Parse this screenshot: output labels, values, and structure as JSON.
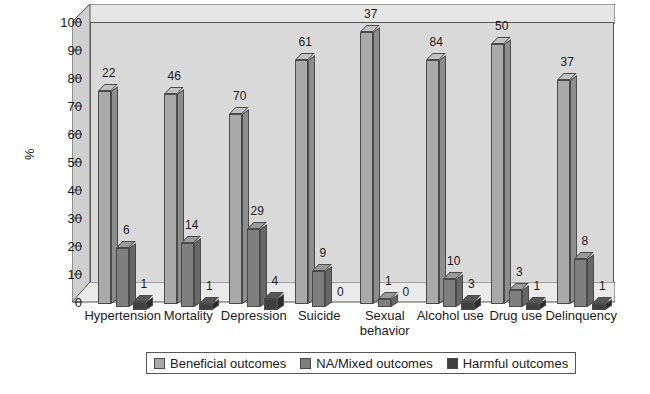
{
  "chart_data": {
    "type": "bar",
    "title": "",
    "xlabel": "",
    "ylabel": "%",
    "ylim": [
      0,
      100
    ],
    "ytick_step": 10,
    "yticks": [
      "0",
      "10",
      "20",
      "30",
      "40",
      "50",
      "60",
      "70",
      "80",
      "90",
      "100"
    ],
    "grid": false,
    "legend_position": "bottom",
    "style": "3d-grouped-columns",
    "categories": [
      "Hypertension",
      "Mortality",
      "Depression",
      "Suicide",
      "Sexual\nbehavior",
      "Alcohol use",
      "Drug use",
      "Delinquency"
    ],
    "series": [
      {
        "name": "Beneficial outcomes",
        "color": "#a9a9a9",
        "labels": [
          22,
          46,
          70,
          61,
          37,
          84,
          50,
          37
        ],
        "values": [
          76,
          75,
          68,
          87,
          97,
          87,
          93,
          80
        ]
      },
      {
        "name": "NA/Mixed outcomes",
        "color": "#7f7f7f",
        "labels": [
          6,
          14,
          29,
          9,
          1,
          10,
          3,
          8
        ],
        "values": [
          21,
          23,
          28,
          13,
          3,
          10,
          6,
          17
        ]
      },
      {
        "name": "Harmful outcomes",
        "color": "#3f3f3f",
        "labels": [
          1,
          1,
          4,
          0,
          0,
          3,
          1,
          1
        ],
        "values": [
          3,
          2,
          4,
          0,
          0,
          3,
          2,
          2
        ]
      }
    ]
  },
  "legend": {
    "items": [
      {
        "label": "Beneficial outcomes",
        "color": "#a9a9a9"
      },
      {
        "label": "NA/Mixed outcomes",
        "color": "#7f7f7f"
      },
      {
        "label": "Harmful outcomes",
        "color": "#3f3f3f"
      }
    ]
  },
  "axis": {
    "y_title": "%"
  }
}
